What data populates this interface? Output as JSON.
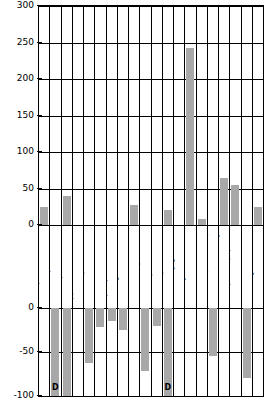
{
  "chart_data": {
    "type": "bar",
    "title": "",
    "xlabel": "",
    "ylabel": "",
    "ylim": [
      -100,
      300
    ],
    "grid": true,
    "legend": null,
    "axis_break": true,
    "yticks_upper": [
      "300",
      "250",
      "200",
      "150",
      "100",
      "50",
      "0"
    ],
    "yticks_lower": [
      "0",
      "-50",
      "-100"
    ],
    "suppressed_marker": "D",
    "categories": [
      "Food products",
      "Tobacco products",
      "Textile products",
      "Apparel",
      "Lumber products",
      "Furniture",
      "Paper products",
      "Printing",
      "Chemicals",
      "Petro-coal products",
      "Rubber-plastic",
      "Leather products",
      "Stone-clay-glass",
      "Primary metals",
      "Fabricated metals",
      "Machin. (non-elec.)",
      "Electric. machinery",
      "Transport equipment",
      "Instruments",
      "All Categories"
    ],
    "values": [
      25,
      null,
      40,
      0,
      null,
      null,
      null,
      null,
      28,
      null,
      null,
      20,
      0,
      242,
      8,
      null,
      65,
      55,
      null,
      25
    ],
    "negative_values": [
      null,
      -115,
      -100,
      null,
      -62,
      -22,
      -15,
      -25,
      null,
      -72,
      -20,
      -115,
      null,
      null,
      null,
      -55,
      null,
      null,
      -80,
      null
    ],
    "markers": [
      "",
      "D",
      "",
      "",
      "",
      "",
      "",
      "",
      "",
      "",
      "",
      "D",
      "",
      "",
      "",
      "",
      "",
      "",
      "",
      ""
    ]
  },
  "colors": {
    "bar_fill": "#a8a8a8",
    "axis": "#000000",
    "background": "#ffffff"
  }
}
